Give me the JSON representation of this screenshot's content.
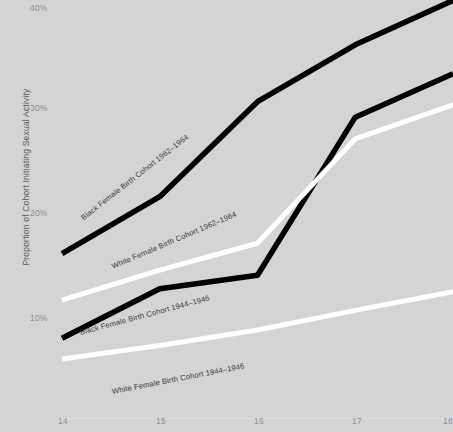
{
  "chart_data": {
    "type": "line",
    "title": "",
    "xlabel": "",
    "ylabel": "Proportion of Cohort Initiating Sexual Activity",
    "x": [
      14,
      15,
      16,
      17,
      18
    ],
    "xticklabels": [
      "14",
      "15",
      "16",
      "17",
      "18"
    ],
    "yticklabels": [
      "10%",
      "20%",
      "30%",
      "40%"
    ],
    "ytickvalues": [
      10,
      20,
      30,
      40
    ],
    "ylim": [
      6,
      41
    ],
    "xlim": [
      14,
      18
    ],
    "grid": false,
    "legend": "inline-labels-on-lines",
    "background_color": "#d4d4d4",
    "series": [
      {
        "name": "Black Female Birth Cohort 1962–1964",
        "color": "#000000",
        "values": [
          15.8,
          21.3,
          30.5,
          36.0,
          40.3
        ]
      },
      {
        "name": "White Female Birth Cohort 1962–1964",
        "color": "#ffffff",
        "values": [
          11.3,
          14.2,
          16.8,
          26.9,
          30.2
        ]
      },
      {
        "name": "Black Female Birth Cohort 1944–1946",
        "color": "#000000",
        "values": [
          7.6,
          12.4,
          13.7,
          29.0,
          33.2
        ]
      },
      {
        "name": "White Female Birth Cohort 1944–1946",
        "color": "#ffffff",
        "values": [
          5.6,
          6.9,
          8.4,
          10.3,
          12.1
        ]
      }
    ]
  },
  "axes": {
    "y_axis_label": "Proportion of Cohort Initiating Sexual Activity",
    "y_ticks": [
      {
        "label": "40%",
        "top": 3
      },
      {
        "label": "30%",
        "top": 103
      },
      {
        "label": "20%",
        "top": 208
      },
      {
        "label": "10%",
        "top": 313
      }
    ],
    "x_ticks": [
      {
        "label": "14",
        "left": 58
      },
      {
        "label": "15",
        "left": 156
      },
      {
        "label": "16",
        "left": 254
      },
      {
        "label": "17",
        "left": 352
      },
      {
        "label": "18",
        "left": 443
      }
    ]
  },
  "series_labels": [
    {
      "name": "black-1962-1964-label",
      "text": "Black Female Birth Cohort 1962–1964",
      "left": 82,
      "top": 214,
      "angle": -38
    },
    {
      "name": "white-1962-1964-label",
      "text": "White Female Birth Cohort 1962–1964",
      "left": 112,
      "top": 262,
      "angle": -23
    },
    {
      "name": "black-1944-1946-label",
      "text": "Black Female Birth Cohort 1944–1946",
      "left": 80,
      "top": 328,
      "angle": -15
    },
    {
      "name": "white-1944-1946-label",
      "text": "White Female Birth Cohort 1944–1946",
      "left": 112,
      "top": 387,
      "angle": -11
    }
  ]
}
